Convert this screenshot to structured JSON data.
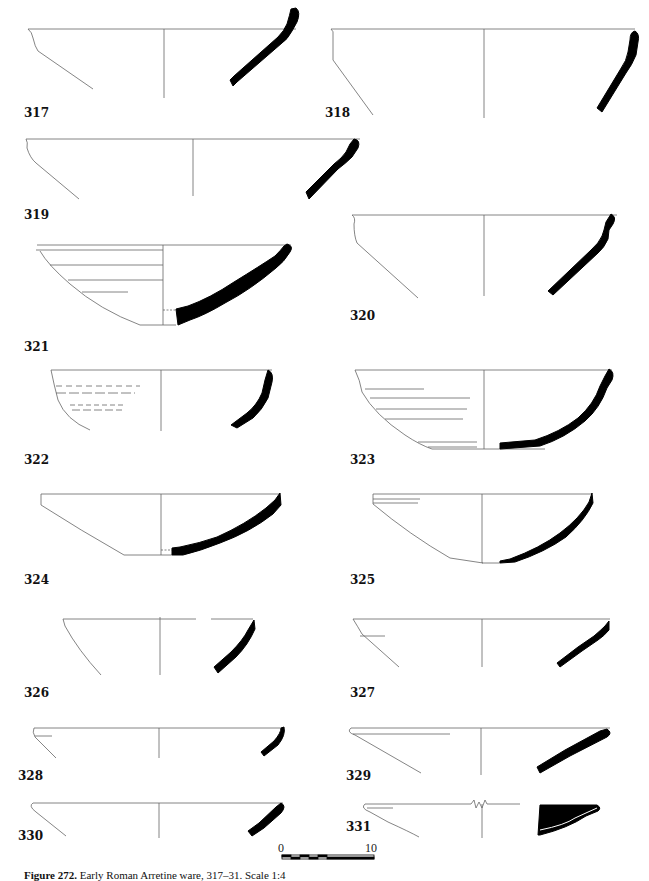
{
  "figure": {
    "caption_label": "Figure 272.",
    "caption_text": "Early Roman Arretine ware, 317–31. Scale 1:4",
    "scale_bar": {
      "start_label": "0",
      "end_label": "10",
      "units": "cm"
    }
  },
  "vessels": [
    {
      "id": "317",
      "label": "317"
    },
    {
      "id": "318",
      "label": "318"
    },
    {
      "id": "319",
      "label": "319"
    },
    {
      "id": "320",
      "label": "320"
    },
    {
      "id": "321",
      "label": "321"
    },
    {
      "id": "322",
      "label": "322"
    },
    {
      "id": "323",
      "label": "323"
    },
    {
      "id": "324",
      "label": "324"
    },
    {
      "id": "325",
      "label": "325"
    },
    {
      "id": "326",
      "label": "326"
    },
    {
      "id": "327",
      "label": "327"
    },
    {
      "id": "328",
      "label": "328"
    },
    {
      "id": "329",
      "label": "329"
    },
    {
      "id": "330",
      "label": "330"
    },
    {
      "id": "331",
      "label": "331"
    }
  ],
  "colors": {
    "outline": "#555555",
    "section_fill": "#000000",
    "background": "#ffffff"
  }
}
